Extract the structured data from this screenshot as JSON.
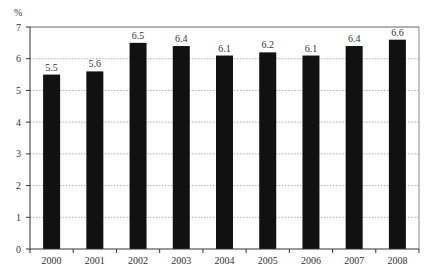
{
  "chart_data": {
    "type": "bar",
    "title": "",
    "xlabel": "",
    "ylabel": "%",
    "ylim": [
      0,
      7
    ],
    "yticks": [
      0,
      1,
      2,
      3,
      4,
      5,
      6,
      7
    ],
    "grid": true,
    "legend": null,
    "categories": [
      "2000",
      "2001",
      "2002",
      "2003",
      "2004",
      "2005",
      "2006",
      "2007",
      "2008"
    ],
    "values": [
      5.5,
      5.6,
      6.5,
      6.4,
      6.1,
      6.2,
      6.1,
      6.4,
      6.6
    ],
    "value_labels": [
      "5.5",
      "5.6",
      "6.5",
      "6.4",
      "6.1",
      "6.2",
      "6.1",
      "6.4",
      "6.6"
    ],
    "bar_color": "#111111",
    "grid_color": "#999999"
  }
}
